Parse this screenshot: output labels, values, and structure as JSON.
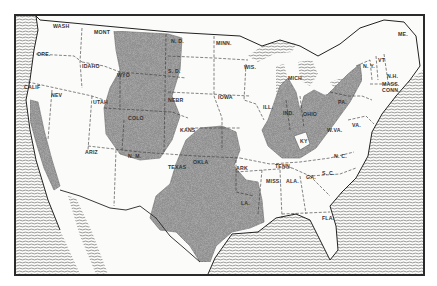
{
  "map": {
    "type": "black-and-white reference map",
    "region": "Contiguous United States",
    "colors": {
      "background": "#fbfbfa",
      "border": "#2a2a2a",
      "stipple_fill": "#8a8a8a",
      "water_hatch": "#555555",
      "state_line": "#333333"
    },
    "patterns": {
      "stipple": "shaded region (stippled)",
      "hatch": "water (horizontal wave lines)"
    },
    "state_labels": [
      {
        "id": "wash",
        "text": "WASH",
        "x": 53,
        "y": 28
      },
      {
        "id": "ore",
        "text": "ORE.",
        "x": 37,
        "y": 56
      },
      {
        "id": "calif",
        "text": "CALIF",
        "x": 24,
        "y": 89
      },
      {
        "id": "nev",
        "text": "NEV",
        "x": 51,
        "y": 97
      },
      {
        "id": "idaho",
        "text": "IDAHO",
        "x": 82,
        "y": 68
      },
      {
        "id": "mont",
        "text": "MONT",
        "x": 94,
        "y": 34
      },
      {
        "id": "wyo",
        "text": "WYO",
        "x": 117,
        "y": 77
      },
      {
        "id": "utah",
        "text": "UTAH",
        "x": 93,
        "y": 104
      },
      {
        "id": "colo",
        "text": "COLO",
        "x": 128,
        "y": 120
      },
      {
        "id": "ariz",
        "text": "ARIZ",
        "x": 85,
        "y": 154
      },
      {
        "id": "nm",
        "text": "N. M.",
        "x": 128,
        "y": 158
      },
      {
        "id": "nd",
        "text": "N. D.",
        "x": 171,
        "y": 43
      },
      {
        "id": "sd",
        "text": "S. D.",
        "x": 168,
        "y": 73
      },
      {
        "id": "nebr",
        "text": "NEBR",
        "x": 168,
        "y": 102
      },
      {
        "id": "kans",
        "text": "KANS",
        "x": 180,
        "y": 132
      },
      {
        "id": "okla",
        "text": "OKLA",
        "x": 193,
        "y": 164
      },
      {
        "id": "texas",
        "text": "TEXAS",
        "x": 168,
        "y": 169
      },
      {
        "id": "minn",
        "text": "MINN.",
        "x": 216,
        "y": 45
      },
      {
        "id": "iowa",
        "text": "IOWA",
        "x": 218,
        "y": 99
      },
      {
        "id": "wis",
        "text": "WIS.",
        "x": 244,
        "y": 69
      },
      {
        "id": "mich",
        "text": "MICH",
        "x": 288,
        "y": 80
      },
      {
        "id": "ill",
        "text": "ILL.",
        "x": 263,
        "y": 109
      },
      {
        "id": "ind",
        "text": "IND.",
        "x": 283,
        "y": 115
      },
      {
        "id": "ohio",
        "text": "OHIO",
        "x": 303,
        "y": 116
      },
      {
        "id": "ky",
        "text": "KY",
        "x": 300,
        "y": 143
      },
      {
        "id": "wva",
        "text": "W.VA.",
        "x": 327,
        "y": 132
      },
      {
        "id": "va",
        "text": "VA.",
        "x": 352,
        "y": 127
      },
      {
        "id": "pa",
        "text": "PA.",
        "x": 338,
        "y": 104
      },
      {
        "id": "ny",
        "text": "N. Y.",
        "x": 363,
        "y": 68
      },
      {
        "id": "vt",
        "text": "VT",
        "x": 378,
        "y": 62
      },
      {
        "id": "nh",
        "text": "N.H.",
        "x": 387,
        "y": 78
      },
      {
        "id": "mass",
        "text": "MASS.",
        "x": 382,
        "y": 86
      },
      {
        "id": "conn",
        "text": "CONN.",
        "x": 382,
        "y": 92
      },
      {
        "id": "me",
        "text": "ME.",
        "x": 398,
        "y": 36
      },
      {
        "id": "nc",
        "text": "N. C.",
        "x": 334,
        "y": 158
      },
      {
        "id": "sc",
        "text": "S. C.",
        "x": 322,
        "y": 175
      },
      {
        "id": "tenn",
        "text": "TENN.",
        "x": 275,
        "y": 168
      },
      {
        "id": "ark",
        "text": "ARK",
        "x": 236,
        "y": 170
      },
      {
        "id": "ga",
        "text": "GA.",
        "x": 306,
        "y": 179
      },
      {
        "id": "ala",
        "text": "ALA.",
        "x": 286,
        "y": 183
      },
      {
        "id": "miss",
        "text": "MISS.",
        "x": 266,
        "y": 183
      },
      {
        "id": "la",
        "text": "LA.",
        "x": 241,
        "y": 205
      },
      {
        "id": "fla",
        "text": "FLA.",
        "x": 322,
        "y": 220
      }
    ]
  }
}
